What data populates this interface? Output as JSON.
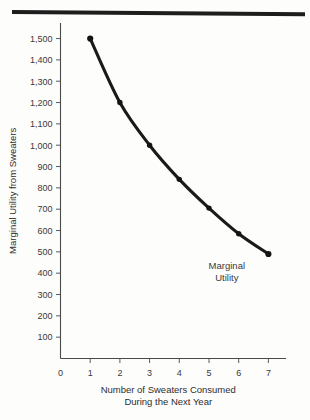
{
  "chart_data": {
    "type": "line",
    "title": "",
    "xlabel": "Number of Sweaters Consumed During the Next Year",
    "xlabel_line1": "Number of Sweaters Consumed",
    "xlabel_line2": "During the Next Year",
    "ylabel": "Marginal Utility from Sweaters",
    "x": [
      1,
      2,
      3,
      4,
      5,
      6,
      7
    ],
    "values": [
      1500,
      1200,
      1000,
      840,
      705,
      585,
      490
    ],
    "series": [
      {
        "name": "Marginal Utility",
        "values": [
          1500,
          1200,
          1000,
          840,
          705,
          585,
          490
        ]
      }
    ],
    "xlim": [
      0,
      7.6
    ],
    "ylim": [
      0,
      1560
    ],
    "xticks": [
      0,
      1,
      2,
      3,
      4,
      5,
      6,
      7
    ],
    "xticklabels": [
      "0",
      "1",
      "2",
      "3",
      "4",
      "5",
      "6",
      "7"
    ],
    "yticks": [
      100,
      200,
      300,
      400,
      500,
      600,
      700,
      800,
      900,
      1000,
      1100,
      1200,
      1300,
      1400,
      1500
    ],
    "yticklabels": [
      "100",
      "200",
      "300",
      "400",
      "500",
      "600",
      "700",
      "800",
      "900",
      "1,000",
      "1,100",
      "1,200",
      "1,300",
      "1,400",
      "1,500"
    ],
    "origin_label": "0",
    "grid": false,
    "legend": "none",
    "annotations": [
      {
        "name": "marginal-utility-label",
        "line1": "Marginal",
        "line2": "Utility",
        "x": 5.6,
        "y": 420
      }
    ],
    "colors": {
      "curve": "#1a1a1a",
      "marker": "#141414",
      "axis": "#4a4a4a",
      "text": "#2e2e2e",
      "background": "#fdfdfc",
      "top_rule": "#1d1d1d"
    }
  }
}
